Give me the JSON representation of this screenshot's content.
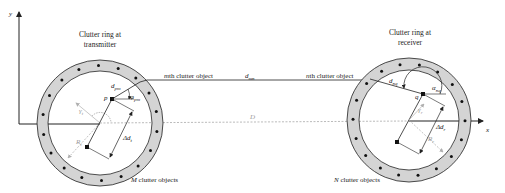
{
  "diagram": {
    "title": "",
    "axes": {
      "x_label": "x",
      "y_label": "y"
    },
    "transmitter_ring": {
      "caption_line1": "Clutter ring at",
      "caption_line2": "transmitter",
      "clutter_count_label_var": "M",
      "clutter_count_label_text": " clutter objects",
      "object_label": "mth clutter object",
      "point_label": "p",
      "distance_label": "d",
      "distance_sub": "pm",
      "angle_label": "φ",
      "angle_sub": "pm",
      "radius_label": "R",
      "radius_sub": "t",
      "direction_label": "γ",
      "direction_sub": "t",
      "offset_label": "Δd",
      "offset_sub": "t",
      "dot_count": 18
    },
    "receiver_ring": {
      "caption_line1": "Clutter ring at",
      "caption_line2": "receiver",
      "clutter_count_label_var": "N",
      "clutter_count_label_text": " clutter objects",
      "object_label": "nth clutter object",
      "point_label": "q",
      "distance_label": "d",
      "distance_sub": "nq",
      "angle_label": "α",
      "angle_sub": "nq",
      "radius_label": "R",
      "radius_sub": "r",
      "direction_label": "γ",
      "direction_sub": "r",
      "offset_label": "Δd",
      "offset_sub": "r",
      "dot_count": 18
    },
    "link": {
      "label": "d",
      "label_sub": "mn"
    },
    "baseline": {
      "label": "D"
    },
    "colors": {
      "ring_fill": "#d4d4d4",
      "stroke": "#222222",
      "dashed": "#a8a8a8",
      "light_arrow": "#b0b0b0"
    }
  }
}
